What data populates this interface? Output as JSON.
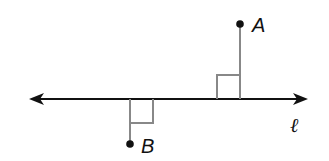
{
  "diagram": {
    "line": {
      "label": "ℓ",
      "y": 99,
      "x1": 30,
      "x2": 307
    },
    "points": [
      {
        "name": "A",
        "x": 240,
        "y": 24,
        "side": "above"
      },
      {
        "name": "B",
        "x": 130,
        "y": 144,
        "side": "below"
      }
    ],
    "right_angle_marks": 2,
    "colors": {
      "line": "#111111",
      "perpendicular": "#888888"
    }
  }
}
